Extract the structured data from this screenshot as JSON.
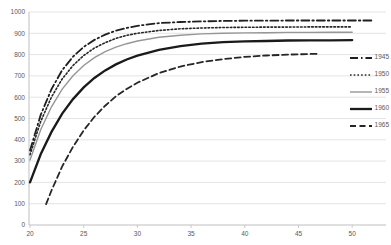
{
  "chart_data": {
    "type": "line",
    "title": "",
    "xlabel": "",
    "ylabel": "",
    "xlim": [
      20,
      52.5
    ],
    "ylim": [
      0,
      1000
    ],
    "x_ticks": [
      20,
      25,
      30,
      35,
      40,
      45,
      50
    ],
    "y_ticks": [
      0,
      100,
      200,
      300,
      400,
      500,
      600,
      700,
      800,
      900,
      1000
    ],
    "grid": "horizontal-only",
    "legend_position": "right",
    "colors": {
      "gridline": "#d9d9d9",
      "axis": "#bfbfbf",
      "tick_label": "#595959",
      "legend_label": "#595959",
      "background": "#ffffff"
    },
    "series": [
      {
        "name": "1945",
        "style": "dash-dot",
        "color": "#1f1f1f",
        "width": 1.8,
        "dash": "8 3 1.5 3",
        "x": [
          20,
          21,
          22,
          23,
          24,
          25,
          26,
          27,
          28,
          29,
          30,
          32,
          34,
          36,
          38,
          40,
          42,
          44,
          46,
          48,
          50,
          52
        ],
        "y": [
          350,
          517,
          638,
          727,
          790,
          836,
          869,
          894,
          912,
          925,
          935,
          948,
          953,
          956,
          958,
          959,
          959,
          960,
          960,
          960,
          960,
          960
        ]
      },
      {
        "name": "1950",
        "style": "dotted",
        "color": "#262626",
        "width": 1.6,
        "dash": "1.6 2.1",
        "x": [
          20,
          21,
          22,
          23,
          24,
          25,
          26,
          27,
          28,
          29,
          30,
          32,
          34,
          36,
          38,
          40,
          42,
          44,
          46,
          48,
          50
        ],
        "y": [
          330,
          486,
          601,
          686,
          749,
          796,
          831,
          856,
          876,
          890,
          900,
          913,
          921,
          925,
          927,
          928,
          929,
          929,
          930,
          930,
          930
        ]
      },
      {
        "name": "1955",
        "style": "solid",
        "color": "#969696",
        "width": 1.4,
        "dash": "",
        "x": [
          20,
          21,
          22,
          23,
          24,
          25,
          26,
          27,
          28,
          29,
          30,
          32,
          34,
          36,
          38,
          40,
          42,
          44,
          46,
          48,
          50
        ],
        "y": [
          305,
          447,
          555,
          638,
          701,
          749,
          786,
          814,
          835,
          851,
          864,
          881,
          891,
          897,
          900,
          902,
          903,
          904,
          904,
          905,
          905
        ]
      },
      {
        "name": "1960",
        "style": "solid-bold",
        "color": "#1a1a1a",
        "width": 2.3,
        "dash": "",
        "x": [
          20,
          21,
          22,
          23,
          24,
          25,
          26,
          27,
          28,
          29,
          30,
          32,
          34,
          36,
          38,
          40,
          42,
          44,
          46,
          48,
          50
        ],
        "y": [
          200,
          332,
          437,
          523,
          591,
          646,
          690,
          726,
          754,
          777,
          795,
          822,
          840,
          851,
          858,
          862,
          864,
          866,
          867,
          867,
          868
        ]
      },
      {
        "name": "1965",
        "style": "dashed",
        "color": "#262626",
        "width": 1.8,
        "dash": "6 3.5",
        "x": [
          21.5,
          22,
          23,
          24,
          25,
          26,
          27,
          28,
          29,
          30,
          32,
          34,
          36,
          38,
          40,
          42,
          44,
          46,
          47
        ],
        "y": [
          98,
          162,
          275,
          367,
          444,
          508,
          560,
          604,
          639,
          668,
          713,
          744,
          765,
          779,
          789,
          796,
          800,
          803,
          804
        ]
      }
    ]
  },
  "layout": {
    "width": 391,
    "height": 245,
    "plot": {
      "x_age20": 30,
      "px_per_year": 10.74,
      "grid_left": 29,
      "grid_right": 386,
      "y_val0": 225,
      "y_val1000": 12
    }
  }
}
